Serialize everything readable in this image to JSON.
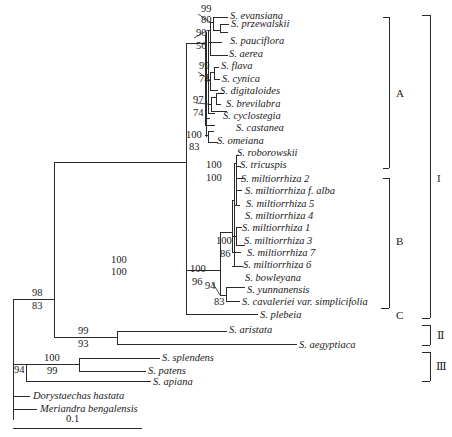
{
  "taxa": [
    {
      "id": "t1",
      "label": "S. evansiana"
    },
    {
      "id": "t2",
      "label": "S. przewalskii"
    },
    {
      "id": "t3",
      "label": "S. pauciflora"
    },
    {
      "id": "t4",
      "label": "S. aerea"
    },
    {
      "id": "t5",
      "label": "S. flava"
    },
    {
      "id": "t6",
      "label": "S. cynica"
    },
    {
      "id": "t7",
      "label": "S. digitaloides"
    },
    {
      "id": "t8",
      "label": "S. brevilabra"
    },
    {
      "id": "t9",
      "label": "S. cyclostegia"
    },
    {
      "id": "t10",
      "label": "S. castanea"
    },
    {
      "id": "t11",
      "label": "S. omeiana"
    },
    {
      "id": "t12",
      "label": "S. roborowskii"
    },
    {
      "id": "t13",
      "label": "S. tricuspis"
    },
    {
      "id": "t14",
      "label": "S. miltiorrhiza 2"
    },
    {
      "id": "t15",
      "label": "S. miltiorrhiza f. alba"
    },
    {
      "id": "t16",
      "label": "S. miltiorrhiza 5"
    },
    {
      "id": "t17",
      "label": "S. miltiorrhiza 4"
    },
    {
      "id": "t18",
      "label": "S. miltiorrhiza 1"
    },
    {
      "id": "t19",
      "label": "S. miltiorrhiza 3"
    },
    {
      "id": "t20",
      "label": "S. miltiorrhiza 7"
    },
    {
      "id": "t21",
      "label": "S. miltiorrhiza 6"
    },
    {
      "id": "t22",
      "label": "S. bowleyana"
    },
    {
      "id": "t23",
      "label": "S. yunnanensis"
    },
    {
      "id": "t24",
      "label": "S. cavaleriei var. simplicifolia"
    },
    {
      "id": "t25",
      "label": "S. plebeia"
    },
    {
      "id": "t26",
      "label": "S. aristata"
    },
    {
      "id": "t27",
      "label": "S. aegyptiaca"
    },
    {
      "id": "t28",
      "label": "S. splendens"
    },
    {
      "id": "t29",
      "label": "S. patens"
    },
    {
      "id": "t30",
      "label": "S. apiana"
    },
    {
      "id": "t31",
      "label": "Dorystaechas hastata"
    },
    {
      "id": "t32",
      "label": "Meriandra bengalensis"
    }
  ],
  "support": {
    "evansiana_przewalskii": {
      "top": "99",
      "bottom": "80"
    },
    "pauciflora_clade": {
      "top": "90",
      "bottom": "56"
    },
    "flava_clade": {
      "top": "99",
      "bottom": "74"
    },
    "brevilabra_clade": {
      "top": "97",
      "bottom": "74"
    },
    "clade_A": {
      "top": "100",
      "bottom": "83"
    },
    "roborowskii_tricuspis": {
      "top": "100",
      "bottom": "100"
    },
    "miltiorrhiza_3_7": {
      "top": "100",
      "bottom": "86"
    },
    "clade_B": {
      "top": "100",
      "bottom": "96"
    },
    "yunnanensis_cavaleriei": {
      "top": "94",
      "bottom": "83"
    },
    "clade_I": {
      "top": "100",
      "bottom": "100"
    },
    "clade_I_II": {
      "top": "98",
      "bottom": "83"
    },
    "clade_II": {
      "top": "99",
      "bottom": "93"
    },
    "splendens_patens": {
      "top": "100",
      "bottom": "99"
    },
    "clade_III": {
      "top": "94",
      "bottom": ""
    }
  },
  "groups": {
    "A": "A",
    "B": "B",
    "C": "C",
    "I": "I",
    "II": "Ⅱ",
    "III": "Ⅲ"
  },
  "scale_bar": {
    "label": "0.1"
  },
  "colors": {
    "line": "#2a2a2a",
    "text": "#1a1a1a",
    "background": "#ffffff"
  }
}
